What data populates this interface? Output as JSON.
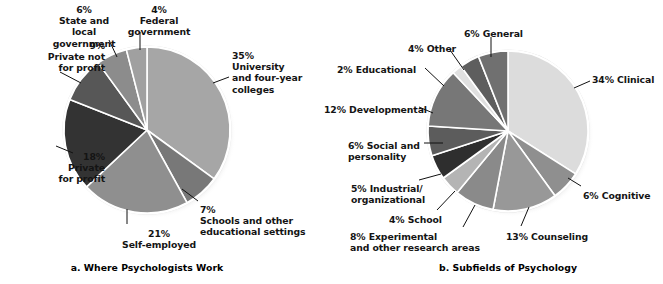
{
  "figure": {
    "background": "#ffffff",
    "leader_color": "#111111",
    "slice_border": "#ffffff",
    "pie_rim": "#d9d9d9",
    "shadow": "#c8c8c8"
  },
  "charts": [
    {
      "id": "where-psychologists-work",
      "caption": "a. Where Psychologists Work",
      "center": {
        "x": 147,
        "y": 130
      },
      "radius": 83,
      "start_angle": -90,
      "direction": "clockwise",
      "labels": [
        {
          "text": "35%\nUniversity\nand four-year\ncolleges",
          "x": 232,
          "y": 50,
          "align": "left"
        },
        {
          "text": "7%\nSchools and other\neducational settings",
          "x": 200,
          "y": 204,
          "align": "left"
        },
        {
          "text": "21%\nSelf-employed",
          "x": 118,
          "y": 228,
          "align": "center"
        },
        {
          "text": "18%\nPrivate\nfor profit",
          "x": 5,
          "y": 151,
          "align": "right"
        },
        {
          "text": "9%\nPrivate not\nfor profit",
          "x": 5,
          "y": 40,
          "align": "right"
        },
        {
          "text": "6%\nState and\nlocal\ngovernment",
          "x": 43,
          "y": 4,
          "align": "center"
        },
        {
          "text": "4%\nFederal\ngovernment",
          "x": 118,
          "y": 4,
          "align": "center"
        }
      ]
    },
    {
      "id": "subfields-of-psychology",
      "caption": "b. Subfields of Psychology",
      "center": {
        "x": 508,
        "y": 131
      },
      "radius": 80,
      "start_angle": -90,
      "direction": "clockwise",
      "labels": [
        {
          "text": "34% Clinical",
          "x": 592,
          "y": 74,
          "align": "left"
        },
        {
          "text": "6% Cognitive",
          "x": 583,
          "y": 190,
          "align": "left"
        },
        {
          "text": "13% Counseling",
          "x": 506,
          "y": 231,
          "align": "left"
        },
        {
          "text": "8% Experimental\nand other research areas",
          "x": 350,
          "y": 231,
          "align": "left"
        },
        {
          "text": "4% School",
          "x": 389,
          "y": 214,
          "align": "left"
        },
        {
          "text": "5% Industrial/\norganizational",
          "x": 351,
          "y": 183,
          "align": "left"
        },
        {
          "text": "6% Social and\npersonality",
          "x": 348,
          "y": 140,
          "align": "left"
        },
        {
          "text": "12% Developmental",
          "x": 324,
          "y": 104,
          "align": "left"
        },
        {
          "text": "2% Educational",
          "x": 337,
          "y": 64,
          "align": "left"
        },
        {
          "text": "4% Other",
          "x": 408,
          "y": 43,
          "align": "left"
        },
        {
          "text": "6% General",
          "x": 464,
          "y": 28,
          "align": "left"
        }
      ]
    }
  ],
  "chart_data": [
    {
      "type": "pie",
      "id": "where-psychologists-work",
      "title": "a. Where Psychologists Work",
      "categories": [
        "University and four-year colleges",
        "Schools and other educational settings",
        "Self-employed",
        "Private for profit",
        "Private not for profit",
        "State and local government",
        "Federal government"
      ],
      "values": [
        35,
        7,
        21,
        18,
        9,
        6,
        4
      ],
      "units": "percent",
      "colors": [
        "#a6a6a6",
        "#787878",
        "#8f8f8f",
        "#333333",
        "#575757",
        "#8c8c8c",
        "#a0a0a0"
      ],
      "legend": "none",
      "labels_inline": true
    },
    {
      "type": "pie",
      "id": "subfields-of-psychology",
      "title": "b. Subfields of Psychology",
      "categories": [
        "Clinical",
        "Cognitive",
        "Counseling",
        "Experimental and other research areas",
        "School",
        "Industrial/organizational",
        "Social and personality",
        "Developmental",
        "Educational",
        "Other",
        "General"
      ],
      "values": [
        34,
        6,
        13,
        8,
        4,
        5,
        6,
        12,
        2,
        4,
        6
      ],
      "units": "percent",
      "colors": [
        "#dcdcdc",
        "#8f8f8f",
        "#989898",
        "#8a8a8a",
        "#b4b4b4",
        "#2e2e2e",
        "#5c5c5c",
        "#777777",
        "#e0e0e0",
        "#5e5e5e",
        "#707070"
      ],
      "legend": "none",
      "labels_inline": true
    }
  ],
  "leaders": {
    "a": [
      {
        "x1": 229,
        "y1": 77,
        "x2": 213,
        "y2": 83
      },
      {
        "x1": 198,
        "y1": 201,
        "x2": 182,
        "y2": 189
      },
      {
        "x1": 127,
        "y1": 224,
        "x2": 127,
        "y2": 209
      },
      {
        "x1": 56,
        "y1": 146,
        "x2": 73,
        "y2": 153
      },
      {
        "x1": 60,
        "y1": 72,
        "x2": 81,
        "y2": 83
      },
      {
        "x1": 109,
        "y1": 40,
        "x2": 117,
        "y2": 57
      },
      {
        "x1": 140,
        "y1": 32,
        "x2": 140,
        "y2": 50
      }
    ],
    "b": [
      {
        "x1": 590,
        "y1": 81,
        "x2": 574,
        "y2": 88
      },
      {
        "x1": 581,
        "y1": 186,
        "x2": 568,
        "y2": 178
      },
      {
        "x1": 521,
        "y1": 226,
        "x2": 529,
        "y2": 207
      },
      {
        "x1": 463,
        "y1": 227,
        "x2": 475,
        "y2": 205
      },
      {
        "x1": 437,
        "y1": 210,
        "x2": 455,
        "y2": 191
      },
      {
        "x1": 419,
        "y1": 180,
        "x2": 441,
        "y2": 174
      },
      {
        "x1": 424,
        "y1": 143,
        "x2": 443,
        "y2": 143
      },
      {
        "x1": 419,
        "y1": 107,
        "x2": 433,
        "y2": 113
      },
      {
        "x1": 425,
        "y1": 68,
        "x2": 444,
        "y2": 86
      },
      {
        "x1": 450,
        "y1": 50,
        "x2": 464,
        "y2": 70
      },
      {
        "x1": 491,
        "y1": 37,
        "x2": 491,
        "y2": 57
      }
    ]
  }
}
